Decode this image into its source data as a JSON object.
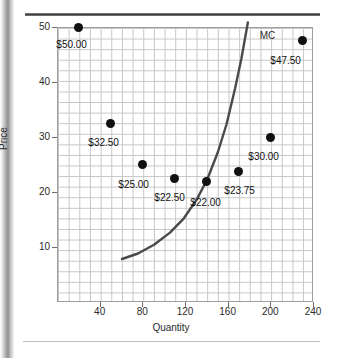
{
  "figure": {
    "axis_title_x": "Quantity",
    "axis_title_y": "Price"
  },
  "chart_data": {
    "type": "scatter",
    "title": "",
    "xlabel": "Quantity",
    "ylabel": "Price",
    "xlim": [
      0,
      240
    ],
    "ylim": [
      0,
      50
    ],
    "grid": true,
    "legend": "none",
    "x_ticks": [
      "40",
      "80",
      "120",
      "160",
      "200",
      "240"
    ],
    "x_tick_values": [
      40,
      80,
      120,
      160,
      200,
      240
    ],
    "y_ticks": [
      "10",
      "20",
      "30",
      "40",
      "50"
    ],
    "y_tick_values": [
      10,
      20,
      30,
      40,
      50
    ],
    "minor_grid_step_x": 10,
    "minor_grid_step_y": 2,
    "points": [
      {
        "x": 20,
        "y": 50.0,
        "label": "$50.00",
        "label_dx": -22,
        "label_dy": 12
      },
      {
        "x": 50,
        "y": 32.5,
        "label": "$32.50",
        "label_dx": -22,
        "label_dy": 14
      },
      {
        "x": 80,
        "y": 25.0,
        "label": "$25.00",
        "label_dx": -24,
        "label_dy": 14
      },
      {
        "x": 110,
        "y": 22.5,
        "label": "$22.50",
        "label_dx": -20,
        "label_dy": 14
      },
      {
        "x": 140,
        "y": 22.0,
        "label": "$22.00",
        "label_dx": -16,
        "label_dy": 16
      },
      {
        "x": 170,
        "y": 23.75,
        "label": "$23.75",
        "label_dx": -14,
        "label_dy": 14
      },
      {
        "x": 200,
        "y": 30.0,
        "label": "$30.00",
        "label_dx": -22,
        "label_dy": 14
      },
      {
        "x": 230,
        "y": 47.5,
        "label": "$47.50",
        "label_dx": -32,
        "label_dy": 14
      }
    ],
    "series": [
      {
        "name": "MC",
        "type": "line",
        "label": "MC",
        "label_at": {
          "x": 190,
          "y": 49.5
        },
        "color": "#4a4a4a",
        "x": [
          60,
          75,
          90,
          105,
          118,
          130,
          140,
          150,
          158,
          166,
          172,
          178
        ],
        "y": [
          8.0,
          9.0,
          10.6,
          12.8,
          15.4,
          18.8,
          22.5,
          27.5,
          32.5,
          39.0,
          44.5,
          51.0
        ]
      }
    ]
  }
}
